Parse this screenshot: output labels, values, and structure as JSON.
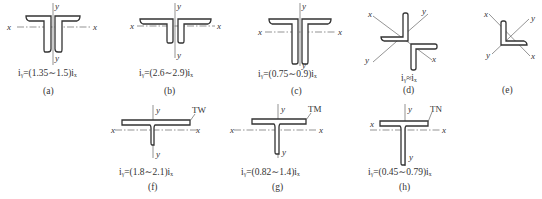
{
  "figure": {
    "panels": [
      {
        "id": "a",
        "label": "(a)",
        "formula": "i_y=(1.35~1.5)i_x",
        "formula_display": "iᵧ=(1.35∼1.5)iₓ",
        "section": "two equal angles back-to-back T (short legs)",
        "axes": [
          "x",
          "y"
        ]
      },
      {
        "id": "b",
        "label": "(b)",
        "formula": "i_y=(2.6~2.9)i_x",
        "formula_display": "iᵧ=(2.6∼2.9)iₓ",
        "section": "two unequal angles, long legs horizontal",
        "axes": [
          "x",
          "y"
        ]
      },
      {
        "id": "c",
        "label": "(c)",
        "formula": "i_y=(0.75~0.9)i_x",
        "formula_display": "iᵧ=(0.75∼0.9)iₓ",
        "section": "two unequal angles, long legs vertical",
        "axes": [
          "x",
          "y"
        ]
      },
      {
        "id": "d",
        "label": "(d)",
        "formula": "i_y≈i_x",
        "formula_display": "iᵧ≈iₓ",
        "section": "two angles cross (star) arrangement",
        "axes": [
          "x",
          "y"
        ]
      },
      {
        "id": "e",
        "label": "(e)",
        "formula": "",
        "formula_display": "",
        "section": "single angle",
        "axes": [
          "x",
          "y"
        ]
      },
      {
        "id": "f",
        "label": "(f)",
        "formula": "i_y=(1.8~2.1)i_x",
        "formula_display": "iᵧ=(1.8∼2.1)iₓ",
        "section": "split T-section",
        "tag": "TW",
        "axes": [
          "x",
          "y"
        ]
      },
      {
        "id": "g",
        "label": "(g)",
        "formula": "i_y=(0.82~1.4)i_x",
        "formula_display": "iᵧ=(0.82∼1.4)iₓ",
        "section": "split T-section",
        "tag": "TM",
        "axes": [
          "x",
          "y"
        ]
      },
      {
        "id": "h",
        "label": "(h)",
        "formula": "i_y=(0.45~0.79)i_x",
        "formula_display": "iᵧ=(0.45∼0.79)iₓ",
        "section": "split T-section",
        "tag": "TN",
        "axes": [
          "x",
          "y"
        ]
      }
    ],
    "axis_labels": {
      "x": "x",
      "y": "y"
    },
    "colors": {
      "line": "#333333",
      "axis": "#666666",
      "background": "#ffffff"
    }
  }
}
